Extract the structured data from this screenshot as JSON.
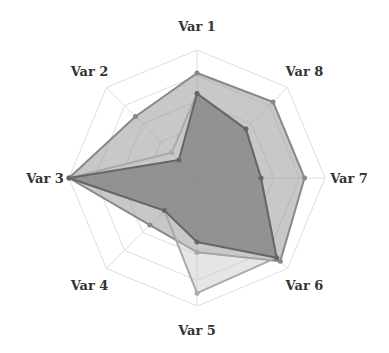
{
  "chart_data": {
    "type": "radar",
    "title": "",
    "categories": [
      "Var 1",
      "Var 2",
      "Var 3",
      "Var 4",
      "Var 5",
      "Var 6",
      "Var 7",
      "Var 8"
    ],
    "levels": 5,
    "range": [
      0,
      5
    ],
    "grid": true,
    "legend": "none",
    "series": [
      {
        "name": "Series A",
        "values": [
          4.1,
          3.4,
          5.0,
          2.6,
          2.9,
          4.6,
          4.2,
          4.2
        ],
        "fill": "#9a9a9a",
        "fill_opacity": 0.55,
        "stroke": "#888888"
      },
      {
        "name": "Series B",
        "values": [
          3.3,
          1.4,
          5.0,
          1.8,
          4.5,
          4.4,
          2.5,
          2.7
        ],
        "fill": "#c8c8c8",
        "fill_opacity": 0.45,
        "stroke": "#aaaaaa"
      },
      {
        "name": "Series C",
        "values": [
          3.3,
          1.0,
          5.0,
          1.8,
          2.5,
          4.4,
          2.5,
          2.7
        ],
        "fill": "#6e6e6e",
        "fill_opacity": 0.6,
        "stroke": "#666666"
      }
    ]
  },
  "layout": {
    "center": [
      197,
      178
    ],
    "radius": 128,
    "label_radius": 152
  }
}
